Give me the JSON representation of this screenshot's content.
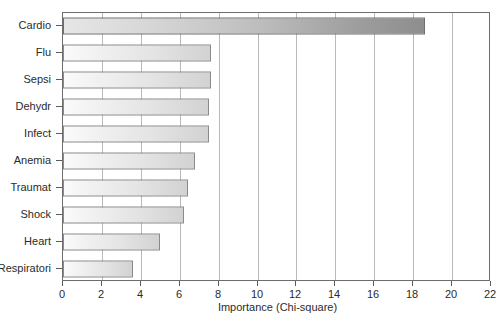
{
  "chart_data": {
    "type": "bar",
    "orientation": "horizontal",
    "title": "",
    "xlabel": "Importance (Chi-square)",
    "ylabel": "",
    "categories": [
      "Cardio",
      "Flu",
      "Sepsi",
      "Dehydr",
      "Infect",
      "Anemia",
      "Traumat",
      "Shock",
      "Heart",
      "Respiratori"
    ],
    "values": [
      18.6,
      7.6,
      7.6,
      7.5,
      7.5,
      6.8,
      6.4,
      6.2,
      5.0,
      3.6
    ],
    "xlim": [
      0,
      22
    ],
    "xticks": [
      0,
      2,
      4,
      6,
      8,
      10,
      12,
      14,
      16,
      18,
      20,
      22
    ],
    "xtick_labels": [
      "0",
      "2",
      "4",
      "6",
      "8",
      "10",
      "12",
      "14",
      "16",
      "18",
      "20",
      "22"
    ],
    "grid": "vertical",
    "legend": null,
    "bar_fill": "#e4e4e4",
    "bar_highlight_fill": "#9d9d9d",
    "bar_border": "#8a8a8a",
    "axis_color": "#6e6e6e",
    "gridline_color": "#b9b9b9",
    "text_color": "#2b2b2b",
    "background": "#ffffff",
    "highlighted_index": 0
  }
}
